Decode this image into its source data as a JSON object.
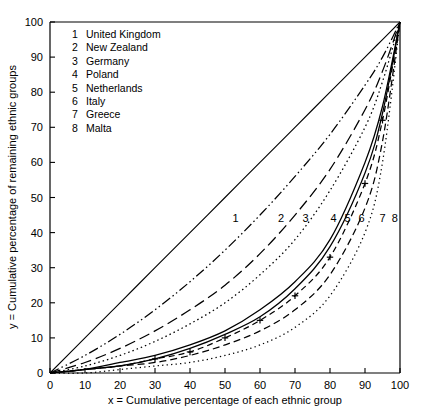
{
  "chart_data": {
    "type": "line",
    "title": "",
    "xlabel": "x = Cumulative percentage of each ethnic group",
    "ylabel": "y = Cumulative percentage of remaining ethnic groups",
    "xlim": [
      0,
      100
    ],
    "ylim": [
      0,
      100
    ],
    "xticks": [
      0,
      10,
      20,
      30,
      40,
      50,
      60,
      70,
      80,
      90,
      100
    ],
    "yticks": [
      0,
      10,
      20,
      30,
      40,
      50,
      60,
      70,
      80,
      90,
      100
    ],
    "grid": false,
    "legend_position": "upper-left-inside",
    "x": [
      0,
      10,
      20,
      30,
      40,
      50,
      60,
      70,
      80,
      90,
      95,
      100
    ],
    "series": [
      {
        "name": "Equality line",
        "key": "equality",
        "style": "solid",
        "marker": "none",
        "color": "#000000",
        "curve_label": "",
        "values": [
          0,
          10,
          20,
          30,
          40,
          50,
          60,
          70,
          80,
          90,
          95,
          100
        ]
      },
      {
        "name": "United Kingdom",
        "key": "1",
        "style": "dash-dot-dot",
        "marker": "none",
        "color": "#000000",
        "curve_label": "1",
        "values": [
          0,
          5,
          11,
          18,
          26,
          35,
          45,
          56,
          68,
          82,
          90,
          100
        ]
      },
      {
        "name": "New Zealand",
        "key": "2",
        "style": "long-dash",
        "marker": "none",
        "color": "#000000",
        "curve_label": "2",
        "values": [
          0,
          3,
          7,
          12,
          18,
          25,
          34,
          45,
          58,
          75,
          86,
          100
        ]
      },
      {
        "name": "Germany",
        "key": "3",
        "style": "fine-dot",
        "marker": "none",
        "color": "#000000",
        "curve_label": "3",
        "values": [
          0,
          2,
          5,
          9,
          14,
          20,
          28,
          38,
          52,
          70,
          83,
          100
        ]
      },
      {
        "name": "Poland",
        "key": "4",
        "style": "solid",
        "marker": "none",
        "color": "#000000",
        "curve_label": "4",
        "values": [
          0,
          1,
          3,
          5,
          8,
          12,
          18,
          26,
          38,
          60,
          76,
          100
        ]
      },
      {
        "name": "Netherlands",
        "key": "5",
        "style": "solid",
        "marker": "none",
        "color": "#000000",
        "curve_label": "5",
        "values": [
          0,
          1,
          2,
          4,
          7,
          11,
          16,
          24,
          36,
          57,
          74,
          100
        ]
      },
      {
        "name": "Italy",
        "key": "6",
        "style": "dash-plus",
        "marker": "plus",
        "color": "#000000",
        "curve_label": "6",
        "values": [
          0,
          1,
          2,
          4,
          6,
          10,
          15,
          22,
          33,
          54,
          72,
          100
        ]
      },
      {
        "name": "Greece",
        "key": "7",
        "style": "dash",
        "marker": "none",
        "color": "#000000",
        "curve_label": "7",
        "values": [
          0,
          1,
          2,
          3,
          5,
          8,
          12,
          18,
          28,
          47,
          66,
          100
        ]
      },
      {
        "name": "Malta",
        "key": "8",
        "style": "dot",
        "marker": "none",
        "color": "#000000",
        "curve_label": "8",
        "values": [
          0,
          0,
          1,
          2,
          3,
          5,
          8,
          13,
          22,
          40,
          60,
          100
        ]
      }
    ]
  },
  "legend": {
    "entries": [
      {
        "num": "1",
        "label": "United Kingdom"
      },
      {
        "num": "2",
        "label": "New Zealand"
      },
      {
        "num": "3",
        "label": "Germany"
      },
      {
        "num": "4",
        "label": "Poland"
      },
      {
        "num": "5",
        "label": "Netherlands"
      },
      {
        "num": "6",
        "label": "Italy"
      },
      {
        "num": "7",
        "label": "Greece"
      },
      {
        "num": "8",
        "label": "Malta"
      }
    ]
  },
  "axes": {
    "x_label": "x = Cumulative percentage of each ethnic group",
    "y_label": "y = Cumulative percentage of remaining ethnic groups",
    "x_tick_labels": [
      "0",
      "10",
      "20",
      "30",
      "40",
      "50",
      "60",
      "70",
      "80",
      "90",
      "100"
    ],
    "y_tick_labels": [
      "0",
      "10",
      "20",
      "30",
      "40",
      "50",
      "60",
      "70",
      "80",
      "90",
      "100"
    ]
  },
  "curve_labels": [
    {
      "text": "1",
      "x": 53,
      "y": 43
    },
    {
      "text": "2",
      "x": 66,
      "y": 43
    },
    {
      "text": "3",
      "x": 73,
      "y": 43
    },
    {
      "text": "4",
      "x": 81,
      "y": 43
    },
    {
      "text": "5",
      "x": 85,
      "y": 43
    },
    {
      "text": "6",
      "x": 89,
      "y": 43
    },
    {
      "text": "7",
      "x": 95,
      "y": 43
    },
    {
      "text": "8",
      "x": 98.5,
      "y": 43
    }
  ]
}
